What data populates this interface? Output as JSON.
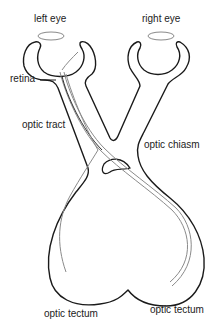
{
  "diagram": {
    "labels": {
      "left_eye": "left eye",
      "right_eye": "right eye",
      "retina": "retina",
      "optic_tract": "optic tract",
      "optic_chiasm": "optic chiasm",
      "optic_tectum_left": "optic tectum",
      "optic_tectum_right": "optic tectum"
    },
    "colors": {
      "outline": "#1a1a1a",
      "nerve_fibers": "#8a8a8a",
      "lens": "#8a8a8a",
      "text": "#222222",
      "background": "#ffffff"
    }
  }
}
